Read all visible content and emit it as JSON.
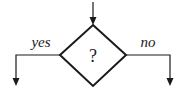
{
  "diagram": {
    "type": "flowchart-decision",
    "decision": {
      "label": "?"
    },
    "branches": [
      {
        "label": "yes",
        "direction": "left"
      },
      {
        "label": "no",
        "direction": "right"
      }
    ],
    "colors": {
      "stroke": "#1a1a1a",
      "background": "#ffffff"
    }
  }
}
